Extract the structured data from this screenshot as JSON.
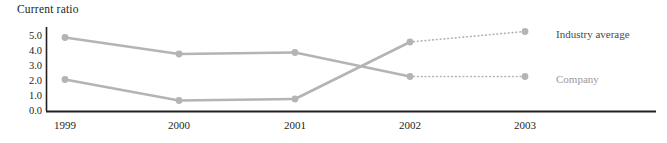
{
  "chart_data": {
    "type": "line",
    "title": "Current ratio",
    "xlabel": "",
    "ylabel": "",
    "categories": [
      "1999",
      "2000",
      "2001",
      "2002",
      "2003"
    ],
    "ylim": [
      0.0,
      5.0
    ],
    "yticks": [
      "5.0",
      "4.0",
      "3.0",
      "2.0",
      "1.0",
      "0.0"
    ],
    "ytick_values": [
      5.0,
      4.0,
      3.0,
      2.0,
      1.0,
      0.0
    ],
    "grid": false,
    "legend_position": "right-inline",
    "series": [
      {
        "name": "Industry average",
        "values": [
          1.8,
          0.4,
          0.5,
          4.3,
          5.0
        ],
        "color": "#b4b4b4",
        "label_color": "#4a4a4a",
        "solid_through": "2002",
        "dotted_from": "2002"
      },
      {
        "name": "Company",
        "values": [
          4.6,
          3.5,
          3.6,
          2.0,
          2.0
        ],
        "color": "#b4b4b4",
        "label_color": "#9a9a9a",
        "solid_through": "2002",
        "dotted_from": "2002"
      }
    ],
    "axis_color": "#231f20",
    "note": "Series cross between 2001 and 2002; final segment 2002-2003 is projected (dotted)."
  },
  "labels": {
    "industry_average": "Industry average",
    "company": "Company"
  }
}
